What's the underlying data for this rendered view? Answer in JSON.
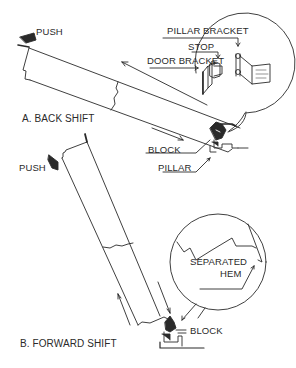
{
  "diagram": {
    "panel_a": {
      "caption": "A. BACK SHIFT",
      "push_label": "PUSH",
      "labels": {
        "pillar_bracket": "PILLAR BRACKET",
        "stop": "STOP",
        "door_bracket": "DOOR BRACKET",
        "block": "BLOCK",
        "pillar": "PILLAR"
      }
    },
    "panel_b": {
      "caption": "B. FORWARD SHIFT",
      "push_label": "PUSH",
      "labels": {
        "separated_hem": [
          "SEPARATED",
          "HEM"
        ],
        "block": "BLOCK"
      }
    },
    "colors": {
      "line": "#2a2a2a",
      "background": "#ffffff"
    }
  }
}
